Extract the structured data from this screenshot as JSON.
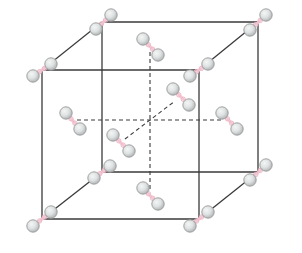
{
  "diagram": {
    "colors": {
      "edge": "#3a3a3a",
      "atom_fill_light": "#f4f6f6",
      "atom_fill_dark": "#b4b8b8",
      "atom_stroke": "#9a9a9a",
      "bond": "#f3c8d4"
    },
    "atom_radius": 6.2,
    "cube": {
      "front_face": {
        "tl": [
          42,
          70
        ],
        "tr": [
          199,
          70
        ],
        "br": [
          199,
          219
        ],
        "bl": [
          42,
          219
        ]
      },
      "back_face": {
        "tl": [
          102,
          22
        ],
        "tr": [
          258,
          22
        ],
        "br": [
          258,
          172
        ],
        "bl": [
          102,
          172
        ]
      },
      "center": [
        150,
        96
      ]
    },
    "solid_edges": [
      [
        [
          42,
          70
        ],
        [
          199,
          70
        ]
      ],
      [
        [
          199,
          70
        ],
        [
          199,
          219
        ]
      ],
      [
        [
          199,
          219
        ],
        [
          42,
          219
        ]
      ],
      [
        [
          42,
          219
        ],
        [
          42,
          70
        ]
      ],
      [
        [
          102,
          22
        ],
        [
          258,
          22
        ]
      ],
      [
        [
          258,
          22
        ],
        [
          258,
          172
        ]
      ],
      [
        [
          258,
          172
        ],
        [
          102,
          172
        ]
      ],
      [
        [
          102,
          172
        ],
        [
          102,
          22
        ]
      ],
      [
        [
          42,
          70
        ],
        [
          102,
          22
        ]
      ],
      [
        [
          199,
          70
        ],
        [
          258,
          22
        ]
      ],
      [
        [
          199,
          219
        ],
        [
          258,
          172
        ]
      ],
      [
        [
          42,
          219
        ],
        [
          102,
          172
        ]
      ]
    ],
    "dashed_axes": [
      {
        "name": "vertical-axis",
        "from": [
          150,
          52
        ],
        "to": [
          150,
          192
        ]
      },
      {
        "name": "horizontal-axis",
        "from": [
          77,
          120
        ],
        "to": [
          223,
          120
        ]
      },
      {
        "name": "depth-axis",
        "from": [
          125,
          139
        ],
        "to": [
          175,
          101
        ]
      }
    ],
    "molecules": [
      {
        "name": "corner-front-top-left",
        "site": "corner",
        "center": [
          42,
          70
        ],
        "a1": [
          33,
          76
        ],
        "a2": [
          51,
          64
        ]
      },
      {
        "name": "corner-front-top-right",
        "site": "corner",
        "center": [
          199,
          70
        ],
        "a1": [
          190,
          76
        ],
        "a2": [
          208,
          64
        ]
      },
      {
        "name": "corner-front-bottom-left",
        "site": "corner",
        "center": [
          42,
          219
        ],
        "a1": [
          33,
          226
        ],
        "a2": [
          51,
          212
        ]
      },
      {
        "name": "corner-front-bottom-right",
        "site": "corner",
        "center": [
          199,
          219
        ],
        "a1": [
          190,
          226
        ],
        "a2": [
          208,
          212
        ]
      },
      {
        "name": "corner-back-top-left",
        "site": "corner",
        "center": [
          102,
          22
        ],
        "a1": [
          96,
          29
        ],
        "a2": [
          111,
          15
        ]
      },
      {
        "name": "corner-back-top-right",
        "site": "corner",
        "center": [
          258,
          22
        ],
        "a1": [
          250,
          30
        ],
        "a2": [
          266,
          15
        ]
      },
      {
        "name": "corner-back-bottom-left",
        "site": "corner",
        "center": [
          102,
          172
        ],
        "a1": [
          94,
          178
        ],
        "a2": [
          110,
          166
        ]
      },
      {
        "name": "corner-back-bottom-right",
        "site": "corner",
        "center": [
          258,
          172
        ],
        "a1": [
          250,
          180
        ],
        "a2": [
          266,
          165
        ]
      },
      {
        "name": "face-center-top",
        "site": "face-center",
        "center": [
          150,
          47
        ],
        "a1": [
          143,
          39
        ],
        "a2": [
          158,
          55
        ]
      },
      {
        "name": "face-center-bottom",
        "site": "face-center",
        "center": [
          150,
          196
        ],
        "a1": [
          143,
          188
        ],
        "a2": [
          158,
          204
        ]
      },
      {
        "name": "face-center-left",
        "site": "face-center",
        "center": [
          72,
          120
        ],
        "a1": [
          66,
          113
        ],
        "a2": [
          80,
          129
        ]
      },
      {
        "name": "face-center-right",
        "site": "face-center",
        "center": [
          228,
          120
        ],
        "a1": [
          222,
          113
        ],
        "a2": [
          237,
          129
        ]
      },
      {
        "name": "face-center-front",
        "site": "face-center",
        "center": [
          120,
          143
        ],
        "a1": [
          113,
          135
        ],
        "a2": [
          129,
          151
        ]
      },
      {
        "name": "face-center-back",
        "site": "face-center",
        "center": [
          180,
          97
        ],
        "a1": [
          173,
          89
        ],
        "a2": [
          189,
          105
        ]
      }
    ]
  }
}
